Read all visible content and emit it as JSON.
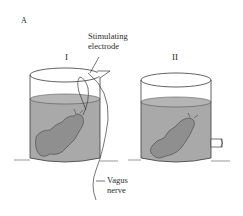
{
  "figure": {
    "panel_label": "A",
    "beakers": [
      {
        "id": "I",
        "label": "I",
        "has_electrode": true,
        "has_outlet": false
      },
      {
        "id": "II",
        "label": "II",
        "has_electrode": false,
        "has_outlet": true
      }
    ],
    "annotations": {
      "electrode_line1": "Stimulating",
      "electrode_line2": "electrode",
      "nerve_line1": "Vagus",
      "nerve_line2": "nerve"
    },
    "colors": {
      "fluid": "#a9a9a9",
      "fluid_surface": "#b8b8b8",
      "heart": "#8f8f8f",
      "outline": "#3a3a3a",
      "background": "#ffffff"
    }
  }
}
